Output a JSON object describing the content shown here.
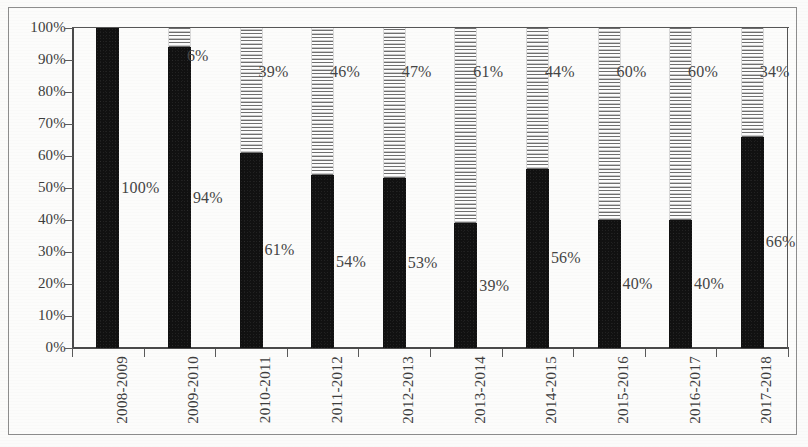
{
  "chart_data": {
    "type": "bar",
    "subtype": "100% stacked column",
    "title": "",
    "subtitle": "",
    "xlabel": "",
    "ylabel": "",
    "ylim": [
      0,
      100
    ],
    "yticks": [
      "0%",
      "10%",
      "20%",
      "30%",
      "40%",
      "50%",
      "60%",
      "70%",
      "80%",
      "90%",
      "100%"
    ],
    "ytick_values": [
      0,
      10,
      20,
      30,
      40,
      50,
      60,
      70,
      80,
      90,
      100
    ],
    "grid": false,
    "legend_position": "none",
    "categories": [
      "2008-2009",
      "2009-2010",
      "2010-2011",
      "2011-2012",
      "2012-2013",
      "2013-2014",
      "2014-2015",
      "2015-2016",
      "2016-2017",
      "2017-2018"
    ],
    "series": [
      {
        "name": "solid-black-series",
        "fill": "solid-black",
        "color": "#111111",
        "stack_position": "bottom",
        "values": [
          100,
          94,
          61,
          54,
          53,
          39,
          56,
          40,
          40,
          66
        ],
        "labels": [
          "100%",
          "94%",
          "61%",
          "54%",
          "53%",
          "39%",
          "56%",
          "40%",
          "40%",
          "66%"
        ]
      },
      {
        "name": "horizontal-hatch-series",
        "fill": "horizontal-lines",
        "color": "#6f6f6f",
        "stack_position": "top",
        "values": [
          0,
          6,
          39,
          46,
          47,
          61,
          44,
          60,
          60,
          34
        ],
        "labels": [
          "",
          "6%",
          "39%",
          "46%",
          "47%",
          "61%",
          "44%",
          "60%",
          "60%",
          "34%"
        ]
      }
    ]
  },
  "figure": {
    "background": "#fcfcfb",
    "border_color": "#8d8d8d",
    "axis_color": "#4a4a4a",
    "text_color": "#3d3d3d"
  }
}
